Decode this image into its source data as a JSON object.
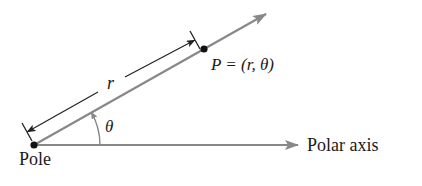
{
  "diagram": {
    "labels": {
      "pole": "Pole",
      "polar_axis": "Polar axis",
      "point": "P = (r, θ)",
      "radius": "r",
      "angle": "θ"
    },
    "colors": {
      "line": "#888888",
      "point": "#111111",
      "dimension": "#222222",
      "text": "#1a1a1a"
    },
    "geometry": {
      "pole": [
        34,
        145
      ],
      "point_P": [
        204,
        49
      ],
      "ray_arrow_tip": [
        266,
        14
      ],
      "polar_axis_arrow_tip": [
        298,
        145
      ],
      "angle_arc_radius": 66
    }
  }
}
